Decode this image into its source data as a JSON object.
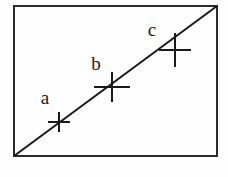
{
  "figure": {
    "title": "",
    "background_color": "#fdfdfc",
    "plot_background_color": "#fefefe",
    "ink_color": "#1a1a1a",
    "frame": {
      "x": 13,
      "y": 5,
      "width": 205,
      "height": 152,
      "stroke_width": 2,
      "color": "#2b2b2b"
    }
  },
  "chart_data": {
    "type": "scatter",
    "title": "",
    "xlabel": "",
    "ylabel": "",
    "grid": false,
    "legend": null,
    "xlim": [
      0,
      100
    ],
    "ylim": [
      0,
      100
    ],
    "line": {
      "name": "trend-line",
      "description": "straight line from lower-left corner to upper-right corner",
      "x": [
        0,
        100
      ],
      "y": [
        0,
        100
      ],
      "stroke_width": 2,
      "color": "#1a1a1a"
    },
    "series": [
      {
        "name": "data-points",
        "marker": "cross",
        "points": [
          {
            "label": "a",
            "x": 22,
            "y": 23,
            "px": 59,
            "py": 122,
            "marker_half_width": 11,
            "marker_half_height": 10,
            "label_px": 45,
            "label_py": 104
          },
          {
            "label": "b",
            "x": 48,
            "y": 46,
            "px": 112,
            "py": 87,
            "marker_half_width": 18,
            "marker_half_height": 15,
            "label_px": 96,
            "label_py": 70
          },
          {
            "label": "c",
            "x": 78,
            "y": 70,
            "px": 175,
            "py": 50,
            "marker_half_width": 16,
            "marker_half_height": 17,
            "label_px": 152,
            "label_py": 36
          }
        ]
      }
    ]
  },
  "labels": {
    "a": "a",
    "b": "b",
    "c": "c"
  }
}
